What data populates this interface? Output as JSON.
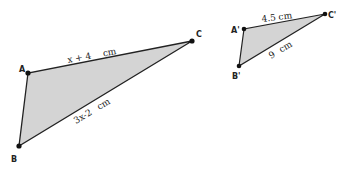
{
  "diagram": {
    "type": "similar-triangles",
    "fill_color": "#d4d4d4",
    "stroke_color": "#222222",
    "triangle1": {
      "vertices": {
        "A": {
          "label": "A",
          "x": 28,
          "y": 73
        },
        "B": {
          "label": "B",
          "x": 19,
          "y": 146
        },
        "C": {
          "label": "C",
          "x": 192,
          "y": 41
        }
      },
      "sides": {
        "AC": {
          "value": "x + 4",
          "unit": "cm"
        },
        "BC": {
          "value": "3x-2",
          "unit": "cm"
        }
      }
    },
    "triangle2": {
      "vertices": {
        "A": {
          "label": "A'",
          "x": 244,
          "y": 29
        },
        "B": {
          "label": "B'",
          "x": 239,
          "y": 66
        },
        "C": {
          "label": "C'",
          "x": 325,
          "y": 14
        }
      },
      "sides": {
        "AC": {
          "value": "4.5",
          "unit": "cm"
        },
        "BC": {
          "value": "9",
          "unit": "cm"
        }
      }
    }
  }
}
